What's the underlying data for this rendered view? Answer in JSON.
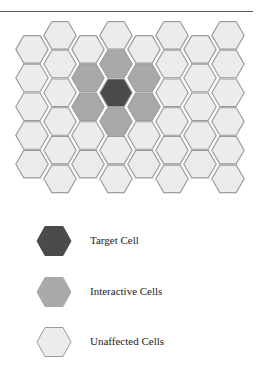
{
  "diagram": {
    "colors": {
      "target": "#4b4b4b",
      "interactive": "#a9a9a9",
      "unaffected": "#ececec",
      "stroke": "#9a9a9a",
      "rule": "#5a5a5a"
    },
    "grid": {
      "column_x": [
        32,
        60,
        88,
        116,
        144,
        172,
        200,
        228
      ],
      "odd_column_top": 35,
      "even_column_top": 21,
      "row_height": 28.7,
      "odd_column_rows": 5,
      "even_column_rows": 6,
      "hex_half_width": 17,
      "hex_edge_inset": 8,
      "cells": {
        "target": [
          [
            3,
            2
          ]
        ],
        "interactive": [
          [
            3,
            1
          ],
          [
            3,
            3
          ],
          [
            2,
            1
          ],
          [
            2,
            2
          ],
          [
            4,
            1
          ],
          [
            4,
            2
          ]
        ]
      }
    },
    "legend": [
      {
        "key": "target",
        "label": "Target Cell",
        "top": 226
      },
      {
        "key": "interactive",
        "label": "Interactive Cells",
        "top": 277
      },
      {
        "key": "unaffected",
        "label": "Unaffected Cells",
        "top": 327
      }
    ]
  }
}
